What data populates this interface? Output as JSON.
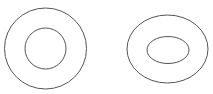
{
  "figures": [
    {
      "name": "concentric-circles",
      "outer": {
        "cx": 45.5,
        "cy": 48.5,
        "rx": 41,
        "ry": 40.5
      },
      "inner": {
        "cx": 45.5,
        "cy": 48.5,
        "rx": 20.5,
        "ry": 20.5
      }
    },
    {
      "name": "concentric-ellipses",
      "outer": {
        "cx": 167.5,
        "cy": 49,
        "rx": 40.5,
        "ry": 34
      },
      "inner": {
        "cx": 168,
        "cy": 50,
        "rx": 21,
        "ry": 13.5
      }
    }
  ],
  "stroke_color": "#555555"
}
